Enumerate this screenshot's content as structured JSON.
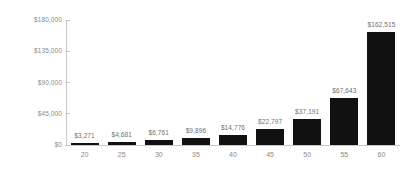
{
  "chart_data": {
    "type": "bar",
    "title": "",
    "subtitle": "",
    "xlabel": "",
    "ylabel": "",
    "categories": [
      "20",
      "25",
      "30",
      "35",
      "40",
      "45",
      "50",
      "55",
      "60"
    ],
    "values": [
      3271,
      4681,
      6761,
      9896,
      14776,
      22797,
      37191,
      67643,
      162515
    ],
    "value_labels": [
      "$3,271",
      "$4,681",
      "$6,761",
      "$9,896",
      "$14,776",
      "$22,797",
      "$37,191",
      "$67,643",
      "$162,515"
    ],
    "ylim": [
      0,
      180000
    ],
    "y_ticks": [
      180000,
      135000,
      90000,
      45000,
      0
    ],
    "y_tick_labels": [
      "$180,000",
      "$135,000",
      "$90,000",
      "$45,000",
      "$0"
    ],
    "grid": false,
    "legend": null,
    "bar_color": "#111111",
    "axis_color": "#c8c8c8",
    "label_color": "#8a8a8a",
    "value_label_color": "#6f6f6f",
    "background_color": "#ffffff"
  }
}
